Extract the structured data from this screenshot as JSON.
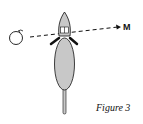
{
  "figure": {
    "caption": "Figure 3",
    "target_label": "M",
    "elements": [
      "apple-object",
      "rat-top-view",
      "dashed-arrow"
    ],
    "colors": {
      "body_fill": "#c8c8c8",
      "stroke": "#111111"
    }
  }
}
